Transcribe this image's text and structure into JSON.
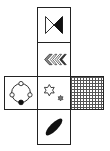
{
  "diagram": {
    "type": "cube-net",
    "faces": [
      {
        "id": "top",
        "position": "column-row-1",
        "symbol": "bowtie",
        "detail": "two triangles meeting at a point; left triangle outlined (white), right triangle filled black"
      },
      {
        "id": "upper-middle",
        "position": "column-row-2",
        "symbol": "chevrons",
        "detail": "four left-pointing chevrons; first filled gray, remaining outlined with dark fill"
      },
      {
        "id": "center",
        "position": "column-row-3",
        "symbol": "stars",
        "detail": "one large outlined six-pointed star and one small gray six-pointed star below right"
      },
      {
        "id": "left",
        "position": "left-of-center",
        "symbol": "circle-with-nodes",
        "detail": "circle with four small circles at top, left, right (white) and bottom (black)"
      },
      {
        "id": "right",
        "position": "right-of-center",
        "symbol": "grid",
        "detail": "face filled with fine crosshatch grid pattern"
      },
      {
        "id": "bottom",
        "position": "column-row-4",
        "symbol": "ellipse",
        "detail": "black filled ellipse tilted diagonally"
      }
    ],
    "colors": {
      "line": "#222222",
      "fill_dark": "#111111",
      "fill_gray": "#888888",
      "background": "#ffffff"
    }
  }
}
